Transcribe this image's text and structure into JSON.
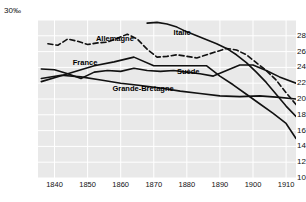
{
  "chart_data": {
    "type": "line",
    "title": "",
    "subtitle": "",
    "xlabel": "",
    "ylabel": "",
    "unit_label": "30‰",
    "grid": true,
    "legend_position": "inline-labels",
    "xlim": [
      1835,
      1913
    ],
    "ylim": [
      10,
      30
    ],
    "ytick_labels": [
      "30",
      "28",
      "26",
      "24",
      "22",
      "20",
      "18",
      "16",
      "14",
      "12",
      "10"
    ],
    "ytick_values": [
      30,
      28,
      26,
      24,
      22,
      20,
      18,
      16,
      14,
      12,
      10
    ],
    "xtick_labels": [
      "1840",
      "1850",
      "1860",
      "1870",
      "1880",
      "1890",
      "1900",
      "1910"
    ],
    "xtick_values": [
      1840,
      1850,
      1860,
      1870,
      1880,
      1890,
      1900,
      1910
    ],
    "series": [
      {
        "name": "Allemagne",
        "label": "Allemagne",
        "style": "dashed",
        "color": "#111111",
        "label_x": 1852.5,
        "label_y": 27.6,
        "x": [
          1838,
          1841,
          1844,
          1847,
          1850,
          1853,
          1856,
          1859,
          1862,
          1865,
          1868,
          1871,
          1874,
          1877,
          1880,
          1883,
          1886,
          1889,
          1892,
          1895,
          1898,
          1901,
          1904,
          1907,
          1910,
          1913
        ],
        "values": [
          27.0,
          26.8,
          27.6,
          27.3,
          26.9,
          27.1,
          27.2,
          27.7,
          28.2,
          27.6,
          26.3,
          25.3,
          25.4,
          25.6,
          25.4,
          25.2,
          25.6,
          26.0,
          26.4,
          26.2,
          25.6,
          24.6,
          23.6,
          22.4,
          20.8,
          19.3
        ]
      },
      {
        "name": "France",
        "label": "France",
        "style": "solid",
        "color": "#111111",
        "label_x": 1845.5,
        "label_y": 24.6,
        "x": [
          1836,
          1840,
          1844,
          1848,
          1852,
          1856,
          1860,
          1864,
          1868,
          1872,
          1876,
          1880,
          1884,
          1888,
          1892,
          1896,
          1900,
          1904,
          1908,
          1913
        ],
        "values": [
          23.8,
          23.7,
          23.2,
          22.6,
          23.4,
          23.6,
          23.5,
          23.9,
          23.6,
          23.5,
          23.6,
          23.4,
          23.2,
          22.9,
          23.6,
          24.3,
          24.3,
          23.6,
          22.8,
          22.0
        ]
      },
      {
        "name": "Grande-Bretagne",
        "label": "Grande-Bretagne",
        "style": "solid",
        "color": "#111111",
        "label_x": 1857.5,
        "label_y": 21.3,
        "x": [
          1836,
          1842,
          1848,
          1854,
          1860,
          1866,
          1872,
          1878,
          1884,
          1890,
          1896,
          1902,
          1908,
          1913
        ],
        "values": [
          22.6,
          23.0,
          22.8,
          22.4,
          22.0,
          21.7,
          21.4,
          21.0,
          20.7,
          20.4,
          20.3,
          20.4,
          20.2,
          20.0
        ]
      },
      {
        "name": "Suède",
        "label": "Suède",
        "style": "solid",
        "color": "#111111",
        "label_x": 1877.0,
        "label_y": 23.4,
        "x": [
          1836,
          1844,
          1852,
          1858,
          1864,
          1870,
          1876,
          1882,
          1886,
          1890,
          1894,
          1898,
          1902,
          1906,
          1910,
          1913
        ],
        "values": [
          22.2,
          23.2,
          24.2,
          24.7,
          25.3,
          24.2,
          24.2,
          24.2,
          24.2,
          22.9,
          21.8,
          20.6,
          19.4,
          18.2,
          16.9,
          15.0
        ]
      },
      {
        "name": "Italie",
        "label": "Italie",
        "style": "solid",
        "color": "#111111",
        "label_x": 1876.0,
        "label_y": 28.3,
        "x": [
          1868,
          1871,
          1874,
          1877,
          1880,
          1883,
          1886,
          1889,
          1892,
          1895,
          1898,
          1901,
          1904,
          1907,
          1910,
          1913
        ],
        "values": [
          29.6,
          29.7,
          29.5,
          29.1,
          28.5,
          28.0,
          27.5,
          27.0,
          26.4,
          25.6,
          24.6,
          23.4,
          22.1,
          20.6,
          19.1,
          17.8
        ]
      }
    ]
  }
}
